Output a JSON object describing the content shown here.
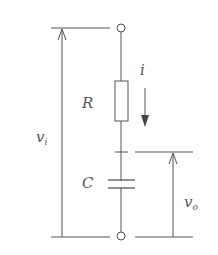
{
  "diagram": {
    "type": "RC series circuit",
    "labels": {
      "resistor": "R",
      "capacitor": "C",
      "current": "i",
      "input_voltage": {
        "main": "v",
        "sub": "i"
      },
      "output_voltage": {
        "main": "v",
        "sub": "o"
      }
    },
    "colors": {
      "line": "#555555",
      "background": "#ffffff"
    }
  }
}
